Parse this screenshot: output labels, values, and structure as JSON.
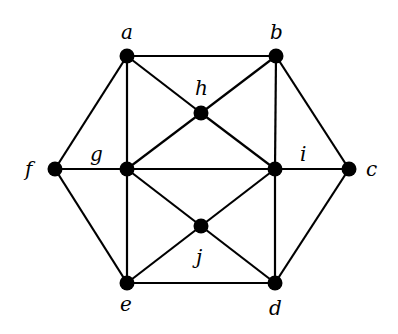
{
  "diagram": {
    "type": "undirected-graph",
    "nodes": [
      {
        "id": "a",
        "label": "a",
        "x": 127,
        "y": 56,
        "lx": 121,
        "ly": 39
      },
      {
        "id": "b",
        "label": "b",
        "x": 276,
        "y": 56,
        "lx": 270,
        "ly": 39
      },
      {
        "id": "h",
        "label": "h",
        "x": 201,
        "y": 113,
        "lx": 195,
        "ly": 95
      },
      {
        "id": "f",
        "label": "f",
        "x": 55,
        "y": 169,
        "lx": 25,
        "ly": 176
      },
      {
        "id": "g",
        "label": "g",
        "x": 127,
        "y": 169,
        "lx": 90,
        "ly": 161
      },
      {
        "id": "i",
        "label": "i",
        "x": 275,
        "y": 169,
        "lx": 300,
        "ly": 161
      },
      {
        "id": "c",
        "label": "c",
        "x": 349,
        "y": 169,
        "lx": 366,
        "ly": 176
      },
      {
        "id": "j",
        "label": "j",
        "x": 201,
        "y": 226,
        "lx": 196,
        "ly": 264
      },
      {
        "id": "e",
        "label": "e",
        "x": 127,
        "y": 283,
        "lx": 120,
        "ly": 311
      },
      {
        "id": "d",
        "label": "d",
        "x": 275,
        "y": 283,
        "lx": 269,
        "ly": 315
      }
    ],
    "edges": [
      [
        "a",
        "b"
      ],
      [
        "a",
        "f"
      ],
      [
        "a",
        "g"
      ],
      [
        "a",
        "h"
      ],
      [
        "b",
        "h"
      ],
      [
        "b",
        "i"
      ],
      [
        "b",
        "c"
      ],
      [
        "h",
        "g"
      ],
      [
        "h",
        "i"
      ],
      [
        "f",
        "g"
      ],
      [
        "g",
        "i"
      ],
      [
        "i",
        "c"
      ],
      [
        "f",
        "e"
      ],
      [
        "g",
        "e"
      ],
      [
        "g",
        "j"
      ],
      [
        "j",
        "i"
      ],
      [
        "j",
        "e"
      ],
      [
        "j",
        "d"
      ],
      [
        "i",
        "d"
      ],
      [
        "c",
        "d"
      ],
      [
        "e",
        "d"
      ]
    ]
  }
}
